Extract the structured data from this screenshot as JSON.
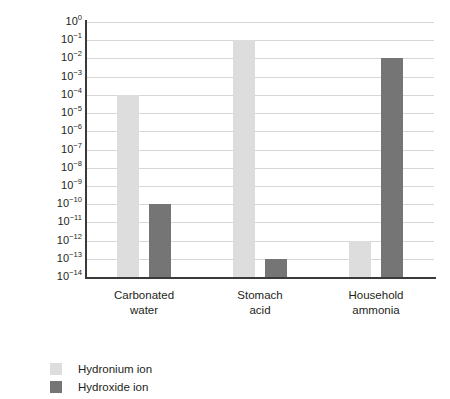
{
  "chart_data": {
    "type": "bar",
    "title": "",
    "xlabel": "",
    "ylabel": "Concentration (M)",
    "ylabel_plain": "Concentration (",
    "ylabel_italic": "M",
    "ylabel_close": ")",
    "categories": [
      "Carbonated water",
      "Stomach acid",
      "Household ammonia"
    ],
    "category_lines": [
      [
        "Carbonated",
        "water"
      ],
      [
        "Stomach",
        "acid"
      ],
      [
        "Household",
        "ammonia"
      ]
    ],
    "scale": "log",
    "ylim": [
      1e-14,
      1
    ],
    "grid": true,
    "legend_position": "below-left",
    "ytick_labels": [
      "10⁰",
      "10⁻¹",
      "10⁻²",
      "10⁻³",
      "10⁻⁴",
      "10⁻⁵",
      "10⁻⁶",
      "10⁻⁷",
      "10⁻⁸",
      "10⁻⁹",
      "10⁻¹⁰",
      "10⁻¹¹",
      "10⁻¹²",
      "10⁻¹³",
      "10⁻¹⁴"
    ],
    "ytick_exponents": [
      "0",
      "-1",
      "-2",
      "-3",
      "-4",
      "-5",
      "-6",
      "-7",
      "-8",
      "-9",
      "-10",
      "-11",
      "-12",
      "-13",
      "-14"
    ],
    "ytick_base": "10",
    "series": [
      {
        "name": "Hydronium ion",
        "color": "#dddddd",
        "values": [
          0.0001,
          0.1,
          1e-12
        ],
        "exponents": [
          -4,
          -1,
          -12
        ]
      },
      {
        "name": "Hydroxide ion",
        "color": "#757575",
        "values": [
          1e-10,
          1e-13,
          0.01
        ],
        "exponents": [
          -10,
          -13,
          -2
        ]
      }
    ]
  },
  "legend": {
    "items": [
      {
        "label": "Hydronium ion",
        "color": "#dddddd"
      },
      {
        "label": "Hydroxide ion",
        "color": "#757575"
      }
    ]
  },
  "colors": {
    "hydronium": "#dddddd",
    "hydroxide": "#757575",
    "axis": "#3a3a3a",
    "grid": "#d7d7d7",
    "text": "#231f20",
    "background": "#ffffff"
  }
}
